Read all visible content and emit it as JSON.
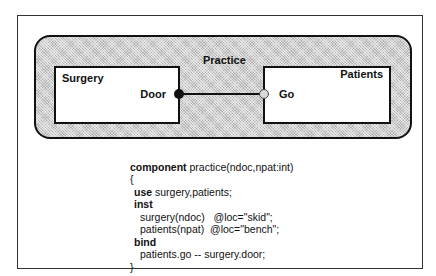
{
  "diagram": {
    "outer_component": {
      "label": "Practice"
    },
    "surgery": {
      "title": "Surgery",
      "port": "Door"
    },
    "patients": {
      "title": "Patients",
      "port": "Go"
    },
    "colors": {
      "line": "#111111",
      "shade": "#cfcfcf",
      "go_port": "#d9d9d9"
    }
  },
  "code": {
    "l1_kw": "component",
    "l1_rest": " practice(ndoc,npat:int)",
    "l2": "{",
    "l3_kw": "use",
    "l3_rest": " surgery,patients;",
    "l4_kw": "inst",
    "l5": "surgery(ndoc)   @loc=\"skid\";",
    "l6": "patients(npat)  @loc=\"bench\";",
    "l7_kw": "bind",
    "l8": "patients.go -- surgery.door;",
    "l9": "}"
  }
}
